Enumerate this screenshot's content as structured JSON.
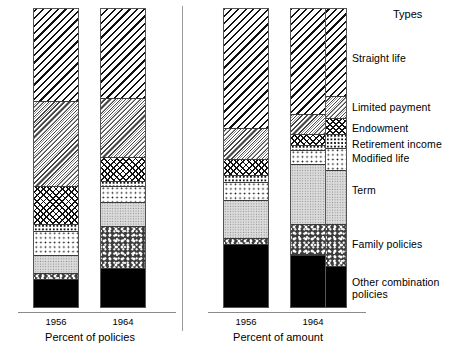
{
  "chart_data": {
    "type": "bar",
    "subtype": "stacked-100-percent",
    "title": "",
    "xlabel": "",
    "ylabel": "",
    "ylim": [
      0,
      100
    ],
    "grid": false,
    "legend_position": "right",
    "legend_title": "Types",
    "categories": [
      "Straight life",
      "Limited payment",
      "Endowment",
      "Retirement income",
      "Modified life",
      "Term",
      "Family policies",
      "Other combination policies"
    ],
    "panels": [
      {
        "name": "Percent of policies",
        "bars": [
          {
            "label": "1956",
            "values": [
              31.0,
              28.3,
              13.0,
              2.3,
              8.0,
              6.0,
              2.0,
              9.4
            ]
          },
          {
            "label": "1964",
            "values": [
              30.0,
              19.7,
              8.0,
              1.7,
              5.3,
              8.0,
              14.3,
              13.0
            ]
          }
        ]
      },
      {
        "name": "Percent of amount",
        "bars": [
          {
            "label": "1956",
            "values": [
              40.0,
              10.3,
              5.4,
              2.3,
              6.0,
              12.7,
              2.0,
              21.3
            ]
          },
          {
            "label": "1964",
            "values": [
              35.3,
              6.7,
              3.7,
              1.6,
              4.7,
              20.0,
              10.7,
              17.3
            ]
          }
        ]
      }
    ],
    "segment_patterns": [
      "diagonal-hatch-dark",
      "diagonal-hatch-light",
      "cross-hatch",
      "dense-dots",
      "open-dots",
      "fine-stipple",
      "coarse-speckle",
      "solid-black"
    ]
  },
  "legend": {
    "title": "Types",
    "items": [
      {
        "label": "Straight life"
      },
      {
        "label": "Limited payment"
      },
      {
        "label": "Endowment"
      },
      {
        "label": "Retirement income"
      },
      {
        "label": "Modified life"
      },
      {
        "label": "Term"
      },
      {
        "label": "Family policies"
      },
      {
        "label": "Other combination\npolicies"
      }
    ]
  },
  "panels": {
    "left": {
      "caption": "Percent of policies",
      "ticks": [
        "1956",
        "1964"
      ]
    },
    "right": {
      "caption": "Percent of amount",
      "ticks": [
        "1956",
        "1964"
      ]
    }
  },
  "colors": {
    "ink": "#000000",
    "axis": "#8a8a8a",
    "divider": "#9a9a9a",
    "bar_outline": "#555555",
    "solid_segment": "#000000",
    "term_segment": "#dcdcdc"
  }
}
